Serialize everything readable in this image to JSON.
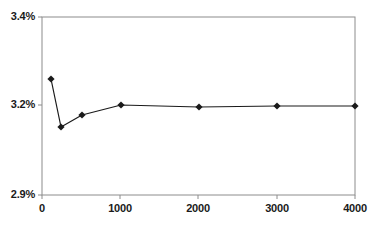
{
  "chart_data": {
    "type": "line",
    "title": "",
    "xlabel": "",
    "ylabel": "",
    "x": [
      100,
      250,
      500,
      1000,
      2000,
      3000,
      4000
    ],
    "values": [
      3.26,
      3.15,
      3.18,
      3.2,
      3.19,
      3.19,
      3.19
    ],
    "series": [
      {
        "name": "",
        "x": [
          100,
          250,
          500,
          1000,
          2000,
          3000,
          4000
        ],
        "values": [
          3.26,
          3.15,
          3.18,
          3.2,
          3.19,
          3.19,
          3.19
        ]
      }
    ],
    "y_tick_labels": [
      "3.4%",
      "3.2%",
      "2.9%"
    ],
    "y_tick_values": [
      3.4,
      3.2,
      2.9
    ],
    "x_tick_labels": [
      "0",
      "1000",
      "2000",
      "3000",
      "4000"
    ],
    "x_tick_values": [
      0,
      1000,
      2000,
      3000,
      4000
    ],
    "xlim": [
      0,
      4000
    ],
    "ylim": [
      2.9,
      3.4
    ],
    "grid": false,
    "legend": false,
    "legend_position": "none",
    "marker": "diamond",
    "line_color": "#1a1a1a",
    "marker_color": "#1a1a1a",
    "axis_color": "#8c8c8c",
    "background_color": "#ffffff",
    "annotations": []
  },
  "plot_geometry": {
    "left": 42,
    "right": 355,
    "top": 17,
    "bottom": 195,
    "y_pixels": [
      17,
      105,
      195
    ],
    "x_pixels": [
      42,
      120,
      198,
      277,
      355
    ],
    "point_pixels": [
      {
        "x": 51,
        "y": 79
      },
      {
        "x": 61,
        "y": 127
      },
      {
        "x": 82,
        "y": 115
      },
      {
        "x": 121,
        "y": 105
      },
      {
        "x": 199,
        "y": 107
      },
      {
        "x": 277,
        "y": 106
      },
      {
        "x": 355,
        "y": 106
      }
    ]
  }
}
